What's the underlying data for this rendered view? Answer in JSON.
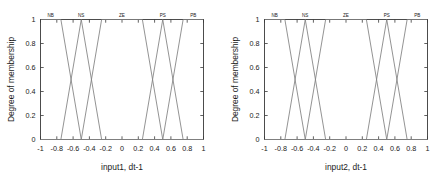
{
  "figure": {
    "panels": [
      {
        "id": "panel-input1",
        "xlabel": "input1, dt-1",
        "ylabel": "Degree of membership"
      },
      {
        "id": "panel-input2",
        "xlabel": "input2, dt-1",
        "ylabel": "Degree of membership"
      }
    ]
  },
  "chart_data": [
    {
      "type": "line",
      "title": "",
      "xlabel": "input1, dt-1",
      "ylabel": "Degree of membership",
      "xlim": [
        -1,
        1
      ],
      "ylim": [
        0,
        1
      ],
      "xticks": [
        -1,
        -0.8,
        -0.6,
        -0.4,
        -0.2,
        0,
        0.2,
        0.4,
        0.6,
        0.8,
        1
      ],
      "xticklabels": [
        "-1",
        "-0.8",
        "-0.6",
        "-0.4",
        "-0.2",
        "0",
        "0.2",
        "0.4",
        "0.6",
        "0.8",
        "1"
      ],
      "yticks": [
        0,
        0.2,
        0.4,
        0.6,
        0.8,
        1
      ],
      "yticklabels": [
        "0",
        "0.2",
        "0.4",
        "0.6",
        "0.8",
        "1"
      ],
      "grid": false,
      "legend": "none",
      "annotations": [
        {
          "text": "NB",
          "x": -0.875,
          "y": 1.06
        },
        {
          "text": "NS",
          "x": -0.5,
          "y": 1.06
        },
        {
          "text": "ZE",
          "x": 0.0,
          "y": 1.06
        },
        {
          "text": "PS",
          "x": 0.5,
          "y": 1.06
        },
        {
          "text": "PB",
          "x": 0.875,
          "y": 1.06
        }
      ],
      "series": [
        {
          "name": "NB",
          "x": [
            -1,
            -0.75,
            -0.5,
            1
          ],
          "values": [
            1,
            1,
            0,
            0
          ]
        },
        {
          "name": "NS",
          "x": [
            -1,
            -0.75,
            -0.5,
            -0.25,
            1
          ],
          "values": [
            0,
            0,
            1,
            0,
            0
          ]
        },
        {
          "name": "ZE",
          "x": [
            -1,
            -0.5,
            -0.25,
            0.25,
            0.5,
            1
          ],
          "values": [
            0,
            0,
            1,
            1,
            0,
            0
          ]
        },
        {
          "name": "PS",
          "x": [
            -1,
            0.25,
            0.5,
            0.75,
            1
          ],
          "values": [
            0,
            0,
            1,
            0,
            0
          ]
        },
        {
          "name": "PB",
          "x": [
            -1,
            0.5,
            0.75,
            1
          ],
          "values": [
            0,
            0,
            1,
            1
          ]
        }
      ]
    },
    {
      "type": "line",
      "title": "",
      "xlabel": "input2, dt-1",
      "ylabel": "Degree of membership",
      "xlim": [
        -1,
        1
      ],
      "ylim": [
        0,
        1
      ],
      "xticks": [
        -1,
        -0.8,
        -0.6,
        -0.4,
        -0.2,
        0,
        0.2,
        0.4,
        0.6,
        0.8,
        1
      ],
      "xticklabels": [
        "-1",
        "-0.8",
        "-0.6",
        "-0.4",
        "-0.2",
        "0",
        "0.2",
        "0.4",
        "0.6",
        "0.8",
        "1"
      ],
      "yticks": [
        0,
        0.2,
        0.4,
        0.6,
        0.8,
        1
      ],
      "yticklabels": [
        "0",
        "0.2",
        "0.4",
        "0.6",
        "0.8",
        "1"
      ],
      "grid": false,
      "legend": "none",
      "annotations": [
        {
          "text": "NB",
          "x": -0.875,
          "y": 1.06
        },
        {
          "text": "NS",
          "x": -0.5,
          "y": 1.06
        },
        {
          "text": "ZE",
          "x": 0.0,
          "y": 1.06
        },
        {
          "text": "PS",
          "x": 0.5,
          "y": 1.06
        },
        {
          "text": "PB",
          "x": 0.875,
          "y": 1.06
        }
      ],
      "series": [
        {
          "name": "NB",
          "x": [
            -1,
            -0.75,
            -0.5,
            1
          ],
          "values": [
            1,
            1,
            0,
            0
          ]
        },
        {
          "name": "NS",
          "x": [
            -1,
            -0.75,
            -0.5,
            -0.25,
            1
          ],
          "values": [
            0,
            0,
            1,
            0,
            0
          ]
        },
        {
          "name": "ZE",
          "x": [
            -1,
            -0.5,
            -0.25,
            0.25,
            0.5,
            1
          ],
          "values": [
            0,
            0,
            1,
            1,
            0,
            0
          ]
        },
        {
          "name": "PS",
          "x": [
            -1,
            0.25,
            0.5,
            0.75,
            1
          ],
          "values": [
            0,
            0,
            1,
            0,
            0
          ]
        },
        {
          "name": "PB",
          "x": [
            -1,
            0.5,
            0.75,
            1
          ],
          "values": [
            0,
            0,
            1,
            1
          ]
        }
      ]
    }
  ],
  "style": {
    "line_color": "#808080",
    "axis_color": "#3a3a3a",
    "text_color": "#1a1a1a",
    "background": "#ffffff"
  }
}
